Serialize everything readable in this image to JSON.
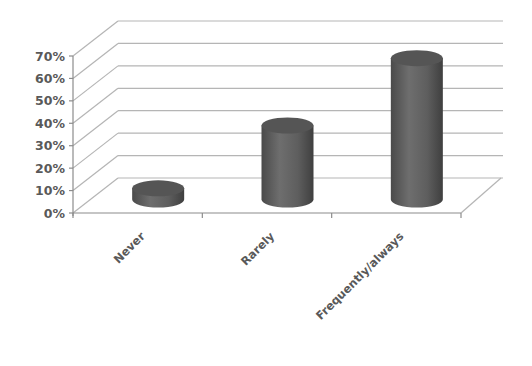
{
  "chart_data": {
    "type": "bar",
    "style": "3d-cylinder",
    "title": "",
    "xlabel": "",
    "ylabel": "",
    "categories": [
      "Never",
      "Rarely",
      "Frequently/always"
    ],
    "values": [
      5,
      33,
      63
    ],
    "value_unit": "%",
    "ylim": [
      0,
      70
    ],
    "y_ticks": [
      "0%",
      "10%",
      "20%",
      "30%",
      "40%",
      "50%",
      "60%",
      "70%"
    ],
    "grid": true,
    "legend": "none",
    "bar_color": "#5e5e5e",
    "grid_color": "#b5b5b5",
    "label_color": "#595959"
  }
}
